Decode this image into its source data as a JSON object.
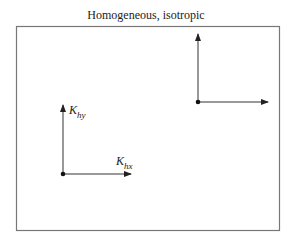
{
  "diagram": {
    "title": "Homogeneous, isotropic",
    "colors": {
      "line": "#333333",
      "frame": "#777777",
      "background": "#ffffff"
    },
    "vector_groups": [
      {
        "name": "lower-left",
        "origin": [
          63,
          174
        ],
        "vertical": {
          "label_main": "K",
          "label_sub": "hy",
          "length": 70
        },
        "horizontal": {
          "label_main": "K",
          "label_sub": "hx",
          "length": 68
        }
      },
      {
        "name": "upper-right",
        "origin": [
          198,
          102
        ],
        "vertical": {
          "label_main": "",
          "label_sub": "",
          "length": 68
        },
        "horizontal": {
          "label_main": "",
          "label_sub": "",
          "length": 70
        }
      }
    ]
  }
}
